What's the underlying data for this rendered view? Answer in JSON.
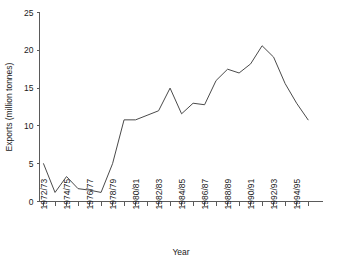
{
  "chart_data": {
    "type": "line",
    "title": "",
    "subtitle": "",
    "xlabel": "Year",
    "ylabel": "Exports (million tonnes)",
    "grid": false,
    "legend": "none",
    "xlim": [
      0,
      23
    ],
    "ylim": [
      0,
      25
    ],
    "yticks": [
      0,
      5,
      10,
      15,
      20,
      25
    ],
    "ytick_labels": [
      "0",
      "5",
      "10",
      "15",
      "20",
      "25"
    ],
    "categories": [
      "1972/73",
      "1973/74",
      "1974/75",
      "1975/76",
      "1976/77",
      "1977/78",
      "1978/79",
      "1979/80",
      "1980/81",
      "1981/82",
      "1982/83",
      "1983/84",
      "1984/85",
      "1985/86",
      "1986/87",
      "1987/88",
      "1988/89",
      "1989/90",
      "1990/91",
      "1991/92",
      "1992/93",
      "1993/94",
      "1994/95",
      "1995/96"
    ],
    "xtick_labels": [
      "1972/73",
      "",
      "1974/75",
      "",
      "1976/77",
      "",
      "1978/79",
      "",
      "1980/81",
      "",
      "1982/83",
      "",
      "1984/85",
      "",
      "1986/87",
      "",
      "1988/89",
      "",
      "1990/91",
      "",
      "1992/93",
      "",
      "1994/95",
      ""
    ],
    "values": [
      5.0,
      1.2,
      3.3,
      1.7,
      1.5,
      1.2,
      5.0,
      10.8,
      10.8,
      11.4,
      12.0,
      15.0,
      11.6,
      13.0,
      12.8,
      16.0,
      17.5,
      17.0,
      18.2,
      20.6,
      19.1,
      15.6,
      13.0,
      10.8
    ],
    "series_name": "Exports",
    "line_color": "#4a4a4a",
    "axis_color": "#5a5a5a"
  }
}
